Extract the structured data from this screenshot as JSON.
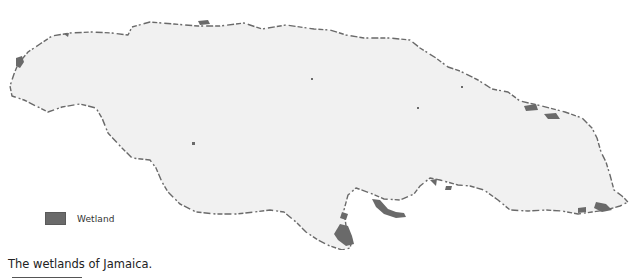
{
  "figure": {
    "caption": "The wetlands of Jamaica.",
    "subject": "Jamaica",
    "colors": {
      "land": "#f1f1f1",
      "coastline": "#6a6a6a",
      "wetland": "#6a6a6a",
      "background": "#ffffff"
    }
  },
  "legend": {
    "items": [
      {
        "label": "Wetland",
        "color": "#6a6a6a"
      }
    ]
  },
  "map": {
    "features": [
      {
        "name": "island-outline",
        "type": "land"
      },
      {
        "name": "wetland-coastal-west",
        "type": "wetland"
      },
      {
        "name": "wetland-south-portland-bight",
        "type": "wetland"
      },
      {
        "name": "wetland-south-peninsula",
        "type": "wetland"
      },
      {
        "name": "wetland-north-coast",
        "type": "wetland"
      },
      {
        "name": "wetland-east-coast",
        "type": "wetland"
      }
    ]
  }
}
